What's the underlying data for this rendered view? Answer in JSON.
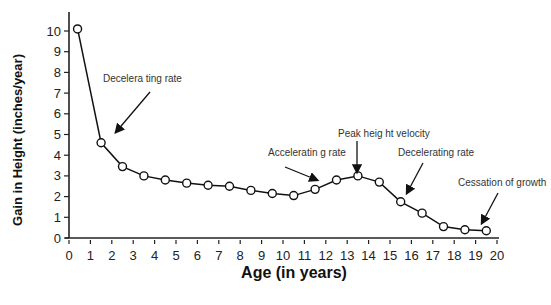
{
  "chart_data": {
    "type": "line",
    "title": "",
    "xlabel": "Age (in years)",
    "ylabel": "Gain in Height  (inches/year)",
    "xlim": [
      0,
      20
    ],
    "ylim": [
      0,
      10
    ],
    "x_ticks": [
      0,
      1,
      2,
      3,
      4,
      5,
      6,
      7,
      8,
      9,
      10,
      11,
      12,
      13,
      14,
      15,
      16,
      17,
      18,
      19,
      20
    ],
    "y_ticks": [
      0,
      1,
      2,
      3,
      4,
      5,
      6,
      7,
      8,
      9,
      10
    ],
    "grid": false,
    "legend": null,
    "series": [
      {
        "name": "Height velocity",
        "marker": "open-circle",
        "x": [
          0.4,
          1.5,
          2.5,
          3.5,
          4.5,
          5.5,
          6.5,
          7.5,
          8.5,
          9.5,
          10.5,
          11.5,
          12.5,
          13.5,
          14.5,
          15.5,
          16.5,
          17.5,
          18.5,
          19.5
        ],
        "y": [
          10.1,
          4.6,
          3.45,
          3.0,
          2.8,
          2.65,
          2.55,
          2.5,
          2.3,
          2.15,
          2.05,
          2.35,
          2.8,
          3.0,
          2.7,
          1.75,
          1.2,
          0.55,
          0.4,
          0.35
        ]
      }
    ],
    "annotations": [
      {
        "text": "Decelera ting rate",
        "x": 2.0,
        "y": 4.4
      },
      {
        "text": "Acceleratin g rate",
        "x": 11.5,
        "y": 2.6
      },
      {
        "text": "Peak heig ht velocity",
        "x": 13.5,
        "y": 3.2
      },
      {
        "text": "Decelerating rate",
        "x": 15.8,
        "y": 2.0
      },
      {
        "text": "Cessation of growth",
        "x": 19.4,
        "y": 0.5
      }
    ]
  }
}
